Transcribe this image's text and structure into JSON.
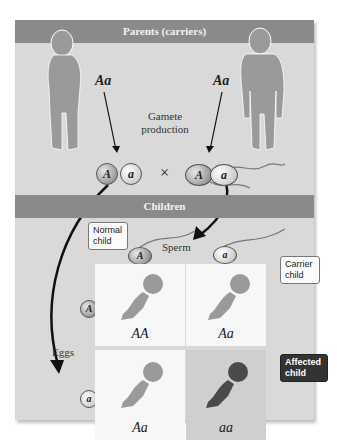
{
  "header": {
    "parents_band": "Parents (carriers)",
    "children_band": "Children"
  },
  "parents": {
    "mother_genotype": "Aa",
    "father_genotype": "Aa",
    "process_label": "Gamete production"
  },
  "gametes": {
    "eggs": [
      "A",
      "a"
    ],
    "sperm": [
      "A",
      "a"
    ],
    "cross_symbol": "×"
  },
  "children": {
    "sperm_label": "Sperm",
    "eggs_label": "Eggs",
    "egg_rows": [
      "A",
      "a"
    ],
    "sperm_cols": [
      "A",
      "a"
    ],
    "cells": [
      {
        "genotype": "AA",
        "shade": "light"
      },
      {
        "genotype": "Aa",
        "shade": "light"
      },
      {
        "genotype": "Aa",
        "shade": "light"
      },
      {
        "genotype": "aa",
        "shade": "dark"
      }
    ],
    "callouts": {
      "normal": "Normal child",
      "carrier": "Carrier child",
      "affected": "Affected child"
    }
  },
  "colors": {
    "panel": "#d9d9d9",
    "band": "#8a8a8a",
    "figure": "#9a9a9a",
    "affected": "#4a4a4a",
    "cell": "#f7f7f7"
  }
}
